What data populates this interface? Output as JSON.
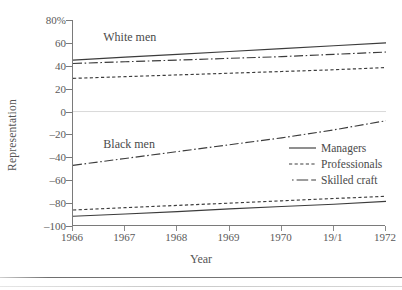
{
  "chart_data": {
    "type": "line",
    "title": "",
    "xlabel": "Year",
    "ylabel": "Representation",
    "x": [
      1966,
      1967,
      1968,
      1969,
      1970,
      1971,
      1972
    ],
    "xticklabels": [
      "1966",
      "1967",
      "1968",
      "1969",
      "1970",
      "19/1",
      "1972"
    ],
    "yticklabels": [
      "80%",
      "60",
      "40",
      "20",
      "0",
      "-20",
      "-40",
      "-60",
      "-80",
      "-100"
    ],
    "ytickvalues": [
      80,
      60,
      40,
      20,
      0,
      -20,
      -40,
      -60,
      -80,
      -100
    ],
    "ylim": [
      -100,
      80
    ],
    "xlim": [
      1966,
      1972
    ],
    "grid": false,
    "zero_line": true,
    "zero_line_color": "#d9d9d9",
    "legend_position": "center-right",
    "annotations": [
      {
        "text": "White men",
        "x": 1966.6,
        "y": 64
      },
      {
        "text": "Black men",
        "x": 1966.6,
        "y": -29
      }
    ],
    "series": [
      {
        "name": "Managers",
        "group": "White men",
        "style": "solid",
        "color": "#3c3c3c",
        "values": [
          45,
          47.5,
          50,
          52.5,
          55,
          57.5,
          60
        ]
      },
      {
        "name": "Professionals",
        "group": "White men",
        "style": "dashed",
        "color": "#3c3c3c",
        "values": [
          29,
          30.5,
          32,
          33.5,
          35,
          36.5,
          38.5
        ]
      },
      {
        "name": "Skilled craft",
        "group": "White men",
        "style": "dashdot",
        "color": "#3c3c3c",
        "values": [
          42,
          43.5,
          45,
          46.5,
          48,
          50,
          52
        ]
      },
      {
        "name": "Managers",
        "group": "Black men",
        "style": "solid",
        "color": "#3c3c3c",
        "values": [
          -91.5,
          -89.5,
          -87.5,
          -85,
          -83,
          -81,
          -78.5
        ]
      },
      {
        "name": "Professionals",
        "group": "Black men",
        "style": "dashed",
        "color": "#3c3c3c",
        "values": [
          -86,
          -84,
          -82,
          -80,
          -78,
          -76,
          -74
        ]
      },
      {
        "name": "Skilled craft",
        "group": "Black men",
        "style": "dashdot",
        "color": "#3c3c3c",
        "values": [
          -47,
          -41,
          -35,
          -29,
          -23,
          -16,
          -8
        ]
      }
    ]
  },
  "legend": {
    "items": [
      {
        "label": "Managers",
        "style": "solid"
      },
      {
        "label": "Professionals",
        "style": "dashed"
      },
      {
        "label": "Skilled craft",
        "style": "dashdot"
      }
    ]
  },
  "axis": {
    "y_title": "Representation",
    "x_title": "Year"
  }
}
